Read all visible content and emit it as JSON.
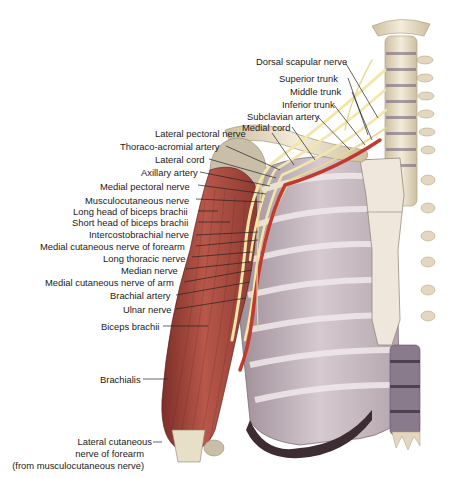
{
  "figure": {
    "colors": {
      "muscle": "#b8574a",
      "muscle_dark": "#7d2f28",
      "bone": "#ece3cf",
      "bone_shade": "#cdbf9f",
      "rib_muscle": "#c7b7bf",
      "nerve": "#f2e6a8",
      "artery": "#c23a2e",
      "disc": "#6e5a7a",
      "leader": "#222222",
      "text": "#1a1a1a"
    }
  },
  "labels_right": [
    {
      "id": "dorsal-scapular-nerve",
      "text": "Dorsal scapular nerve"
    },
    {
      "id": "superior-trunk",
      "text": "Superior trunk"
    },
    {
      "id": "middle-trunk",
      "text": "Middle trunk"
    },
    {
      "id": "inferior-trunk",
      "text": "Inferior trunk"
    },
    {
      "id": "subclavian-artery",
      "text": "Subclavian artery"
    },
    {
      "id": "medial-cord",
      "text": "Medial cord"
    }
  ],
  "labels_left": [
    {
      "id": "lateral-pectoral-nerve",
      "text": "Lateral pectoral nerve"
    },
    {
      "id": "thoraco-acromial-artery",
      "text": "Thoraco-acromial artery"
    },
    {
      "id": "lateral-cord",
      "text": "Lateral cord"
    },
    {
      "id": "axillary-artery",
      "text": "Axillary artery"
    },
    {
      "id": "medial-pectoral-nerve",
      "text": "Medial pectoral nerve"
    },
    {
      "id": "musculocutaneous-nerve",
      "text": "Musculocutaneous nerve"
    },
    {
      "id": "long-head-biceps",
      "text": "Long head of biceps brachii"
    },
    {
      "id": "short-head-biceps",
      "text": "Short head of biceps brachii"
    },
    {
      "id": "intercostobrachial-nerve",
      "text": "Intercostobrachial nerve"
    },
    {
      "id": "medial-cutaneous-nerve-forearm",
      "text": "Medial cutaneous nerve of forearm"
    },
    {
      "id": "long-thoracic-nerve",
      "text": "Long thoracic nerve"
    },
    {
      "id": "median-nerve",
      "text": "Median nerve"
    },
    {
      "id": "medial-cutaneous-nerve-arm",
      "text": "Medial cutaneous nerve of arm"
    },
    {
      "id": "brachial-artery",
      "text": "Brachial artery"
    },
    {
      "id": "ulnar-nerve",
      "text": "Ulnar nerve"
    },
    {
      "id": "biceps-brachii",
      "text": "Biceps brachii"
    },
    {
      "id": "brachialis",
      "text": "Brachialis"
    }
  ],
  "label_bottom": {
    "id": "lateral-cutaneous-nerve-forearm",
    "lines": [
      "Lateral cutaneous",
      "nerve of forearm",
      "(from musculocutaneous nerve)"
    ]
  }
}
